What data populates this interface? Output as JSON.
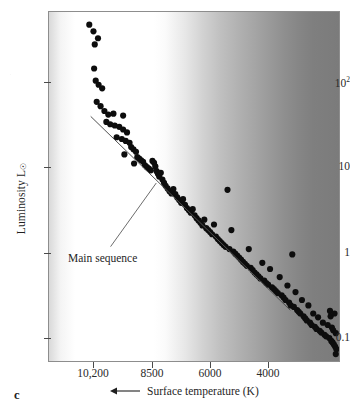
{
  "figure": {
    "letter": "c",
    "type": "hertzsprung-russell-diagram"
  },
  "annotations": {
    "main_sequence_label": "Main sequence"
  },
  "chart_data": {
    "type": "scatter",
    "title": "",
    "subtitle": "",
    "xlabel": "Surface temperature (K)",
    "ylabel": "Luminosity L⊙",
    "x_axis_direction": "decreasing (arrow points left)",
    "y_axis_direction": "increasing (arrow points up)",
    "xscale": "reversed-linear",
    "yscale": "log",
    "grid": false,
    "legend": null,
    "xticks": [
      "10,200",
      "8500",
      "6000",
      "4000"
    ],
    "xtick_values": [
      10200,
      8500,
      6000,
      4000
    ],
    "yticks": [
      "10²",
      "10",
      "1",
      "0.1"
    ],
    "ytick_values": [
      100,
      10,
      1,
      0.1
    ],
    "ylim": [
      0.06,
      600
    ],
    "xlim": [
      11600,
      2600
    ],
    "background": "grayscale gradient, white at hot/left fading to dark gray at cool/right",
    "annotations": [
      {
        "text": "Main sequence",
        "kind": "leader-line-callout",
        "points_to": "the diagonal band of stars"
      }
    ],
    "series": [
      {
        "name": "stars",
        "marker": "filled circle",
        "color": "#0d0d0d",
        "points": [
          [
            10350,
            430
          ],
          [
            10220,
            360
          ],
          [
            10080,
            300
          ],
          [
            10180,
            255
          ],
          [
            10200,
            135
          ],
          [
            10150,
            98
          ],
          [
            10060,
            88
          ],
          [
            9950,
            80
          ],
          [
            10120,
            56
          ],
          [
            10000,
            50
          ],
          [
            9880,
            44
          ],
          [
            9760,
            40
          ],
          [
            9600,
            41
          ],
          [
            9300,
            39
          ],
          [
            9820,
            33
          ],
          [
            9700,
            31
          ],
          [
            9560,
            30
          ],
          [
            9420,
            29
          ],
          [
            9300,
            27
          ],
          [
            9180,
            25
          ],
          [
            9500,
            22
          ],
          [
            9340,
            21
          ],
          [
            9220,
            20
          ],
          [
            9100,
            19
          ],
          [
            9050,
            17
          ],
          [
            8980,
            16
          ],
          [
            8900,
            15
          ],
          [
            9260,
            14
          ],
          [
            8860,
            13
          ],
          [
            8800,
            12.5
          ],
          [
            8740,
            12
          ],
          [
            8680,
            11.5
          ],
          [
            8960,
            11
          ],
          [
            8620,
            10.5
          ],
          [
            8560,
            10
          ],
          [
            8500,
            9.6
          ],
          [
            8440,
            9.2
          ],
          [
            8390,
            11.8
          ],
          [
            8340,
            11.2
          ],
          [
            8300,
            10.2
          ],
          [
            8260,
            9.0
          ],
          [
            8220,
            8.4
          ],
          [
            8180,
            7.8
          ],
          [
            8130,
            8.6
          ],
          [
            8080,
            7.2
          ],
          [
            8030,
            6.6
          ],
          [
            7980,
            6.1
          ],
          [
            7920,
            5.7
          ],
          [
            7860,
            5.3
          ],
          [
            7800,
            5.0
          ],
          [
            7740,
            5.6
          ],
          [
            7680,
            4.9
          ],
          [
            7620,
            4.5
          ],
          [
            7560,
            4.2
          ],
          [
            7500,
            3.9
          ],
          [
            7440,
            4.3
          ],
          [
            7380,
            3.7
          ],
          [
            7320,
            3.4
          ],
          [
            7260,
            3.2
          ],
          [
            7200,
            3.0
          ],
          [
            7140,
            3.3
          ],
          [
            7080,
            2.8
          ],
          [
            7020,
            2.6
          ],
          [
            6960,
            2.45
          ],
          [
            6900,
            2.3
          ],
          [
            6840,
            2.15
          ],
          [
            6780,
            2.5
          ],
          [
            6720,
            2.0
          ],
          [
            6660,
            1.9
          ],
          [
            6600,
            1.8
          ],
          [
            6540,
            1.7
          ],
          [
            6480,
            2.2
          ],
          [
            6420,
            1.6
          ],
          [
            6360,
            1.5
          ],
          [
            6300,
            1.42
          ],
          [
            6240,
            1.35
          ],
          [
            6180,
            1.28
          ],
          [
            6120,
            1.22
          ],
          [
            6060,
            5.5
          ],
          [
            6000,
            1.15
          ],
          [
            5940,
            1.9
          ],
          [
            5880,
            1.08
          ],
          [
            5820,
            1.02
          ],
          [
            5760,
            0.97
          ],
          [
            5700,
            0.92
          ],
          [
            5640,
            0.87
          ],
          [
            5580,
            0.82
          ],
          [
            5520,
            0.78
          ],
          [
            5460,
            0.74
          ],
          [
            5400,
            1.15
          ],
          [
            5340,
            0.7
          ],
          [
            5280,
            0.66
          ],
          [
            5220,
            0.62
          ],
          [
            5160,
            0.59
          ],
          [
            5100,
            0.56
          ],
          [
            5040,
            0.53
          ],
          [
            4980,
            0.8
          ],
          [
            4920,
            0.5
          ],
          [
            4860,
            0.47
          ],
          [
            4800,
            0.45
          ],
          [
            4740,
            0.68
          ],
          [
            4680,
            0.42
          ],
          [
            4620,
            0.4
          ],
          [
            4560,
            0.38
          ],
          [
            4500,
            0.36
          ],
          [
            4440,
            0.55
          ],
          [
            4380,
            0.34
          ],
          [
            4320,
            0.32
          ],
          [
            4260,
            0.3
          ],
          [
            4200,
            0.44
          ],
          [
            4150,
            0.28
          ],
          [
            4100,
            0.26
          ],
          [
            4050,
            1.0
          ],
          [
            4000,
            0.25
          ],
          [
            3950,
            0.37
          ],
          [
            3900,
            0.23
          ],
          [
            3850,
            0.22
          ],
          [
            3800,
            0.21
          ],
          [
            3750,
            0.3
          ],
          [
            3700,
            0.195
          ],
          [
            3650,
            0.185
          ],
          [
            3600,
            0.175
          ],
          [
            3550,
            0.26
          ],
          [
            3500,
            0.165
          ],
          [
            3450,
            0.155
          ],
          [
            3400,
            0.21
          ],
          [
            3350,
            0.148
          ],
          [
            3300,
            0.14
          ],
          [
            3250,
            0.19
          ],
          [
            3200,
            0.133
          ],
          [
            3150,
            0.127
          ],
          [
            3100,
            0.165
          ],
          [
            3050,
            0.12
          ],
          [
            3000,
            0.115
          ],
          [
            2950,
            0.155
          ],
          [
            2900,
            0.11
          ],
          [
            2880,
            0.225
          ],
          [
            2860,
            0.195
          ],
          [
            2840,
            0.102
          ],
          [
            2820,
            0.145
          ],
          [
            2800,
            0.098
          ],
          [
            2780,
            0.135
          ],
          [
            2760,
            0.093
          ],
          [
            2740,
            0.21
          ],
          [
            2720,
            0.088
          ],
          [
            2700,
            0.125
          ],
          [
            2680,
            0.082
          ],
          [
            2700,
            0.072
          ]
        ]
      }
    ]
  }
}
